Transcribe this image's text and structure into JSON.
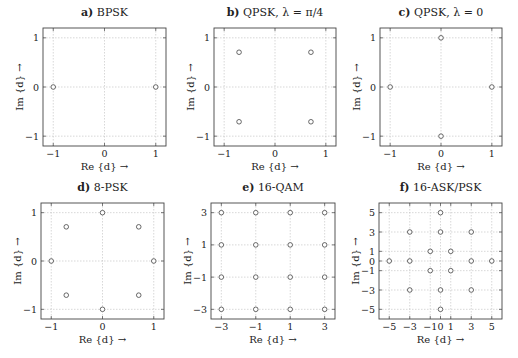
{
  "figure": {
    "xlabel": "Re {d} →",
    "ylabel": "Im {d} →"
  },
  "chart_data": [
    {
      "type": "scatter",
      "panel": "a)",
      "title": "BPSK",
      "xlabel": "Re {d} →",
      "ylabel": "Im {d} →",
      "xlim": [
        -1.2,
        1.2
      ],
      "ylim": [
        -1.2,
        1.2
      ],
      "xticks": [
        -1,
        0,
        1
      ],
      "yticks": [
        -1,
        0,
        1
      ],
      "grid": true,
      "points": [
        [
          -1,
          0
        ],
        [
          1,
          0
        ]
      ]
    },
    {
      "type": "scatter",
      "panel": "b)",
      "title": "QPSK, λ = π/4",
      "xlabel": "Re {d} →",
      "ylabel": "Im {d} →",
      "xlim": [
        -1.2,
        1.2
      ],
      "ylim": [
        -1.2,
        1.2
      ],
      "xticks": [
        -1,
        0,
        1
      ],
      "yticks": [
        -1,
        0,
        1
      ],
      "grid": true,
      "points": [
        [
          -0.707,
          0.707
        ],
        [
          0.707,
          0.707
        ],
        [
          -0.707,
          -0.707
        ],
        [
          0.707,
          -0.707
        ]
      ]
    },
    {
      "type": "scatter",
      "panel": "c)",
      "title": "QPSK, λ = 0",
      "xlabel": "Re {d} →",
      "ylabel": "Im {d} →",
      "xlim": [
        -1.2,
        1.2
      ],
      "ylim": [
        -1.2,
        1.2
      ],
      "xticks": [
        -1,
        0,
        1
      ],
      "yticks": [
        -1,
        0,
        1
      ],
      "grid": true,
      "points": [
        [
          0,
          1
        ],
        [
          -1,
          0
        ],
        [
          1,
          0
        ],
        [
          0,
          -1
        ]
      ]
    },
    {
      "type": "scatter",
      "panel": "d)",
      "title": "8-PSK",
      "xlabel": "Re {d} →",
      "ylabel": "Im {d} →",
      "xlim": [
        -1.2,
        1.2
      ],
      "ylim": [
        -1.2,
        1.2
      ],
      "xticks": [
        -1,
        0,
        1
      ],
      "yticks": [
        -1,
        0,
        1
      ],
      "grid": true,
      "points": [
        [
          0,
          1
        ],
        [
          -0.707,
          0.707
        ],
        [
          0.707,
          0.707
        ],
        [
          -1,
          0
        ],
        [
          1,
          0
        ],
        [
          -0.707,
          -0.707
        ],
        [
          0.707,
          -0.707
        ],
        [
          0,
          -1
        ]
      ]
    },
    {
      "type": "scatter",
      "panel": "e)",
      "title": "16-QAM",
      "xlabel": "Re {d} →",
      "ylabel": "Im {d} →",
      "xlim": [
        -3.6,
        3.6
      ],
      "ylim": [
        -3.6,
        3.6
      ],
      "xticks": [
        -3,
        -1,
        1,
        3
      ],
      "yticks": [
        -3,
        -1,
        1,
        3
      ],
      "grid": true,
      "points": [
        [
          -3,
          3
        ],
        [
          -1,
          3
        ],
        [
          1,
          3
        ],
        [
          3,
          3
        ],
        [
          -3,
          1
        ],
        [
          -1,
          1
        ],
        [
          1,
          1
        ],
        [
          3,
          1
        ],
        [
          -3,
          -1
        ],
        [
          -1,
          -1
        ],
        [
          1,
          -1
        ],
        [
          3,
          -1
        ],
        [
          -3,
          -3
        ],
        [
          -1,
          -3
        ],
        [
          1,
          -3
        ],
        [
          3,
          -3
        ]
      ]
    },
    {
      "type": "scatter",
      "panel": "f)",
      "title": "16-ASK/PSK",
      "xlabel": "Re {d} →",
      "ylabel": "Im {d} →",
      "xlim": [
        -6,
        6
      ],
      "ylim": [
        -6,
        6
      ],
      "xticks": [
        -5,
        -3,
        -1,
        0,
        1,
        3,
        5
      ],
      "yticks": [
        -5,
        -3,
        -1,
        0,
        1,
        3,
        5
      ],
      "grid": true,
      "points": [
        [
          0,
          5
        ],
        [
          -3,
          3
        ],
        [
          0,
          3
        ],
        [
          3,
          3
        ],
        [
          -1,
          1
        ],
        [
          1,
          1
        ],
        [
          -5,
          0
        ],
        [
          -3,
          0
        ],
        [
          3,
          0
        ],
        [
          5,
          0
        ],
        [
          -1,
          -1
        ],
        [
          1,
          -1
        ],
        [
          -3,
          -3
        ],
        [
          0,
          -3
        ],
        [
          3,
          -3
        ],
        [
          0,
          -5
        ]
      ]
    }
  ]
}
